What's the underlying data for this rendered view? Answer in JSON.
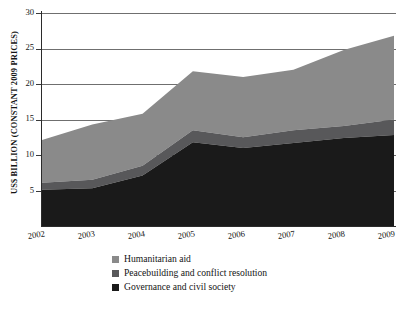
{
  "chart_data": {
    "type": "area",
    "title": "",
    "subtitle": "",
    "xlabel": "",
    "ylabel": "US$ BILLION (CONSTANT 2009 PRICES)",
    "stacked": true,
    "grid": true,
    "legend_position": "bottom",
    "x": [
      2002,
      2003,
      2004,
      2005,
      2006,
      2007,
      2008,
      2009
    ],
    "categories": [
      "2002",
      "2003",
      "2004",
      "2005",
      "2006",
      "2007",
      "2008",
      "2009"
    ],
    "xlim": [
      2002,
      2009
    ],
    "ylim": [
      0,
      30
    ],
    "yticks": [
      0,
      5,
      10,
      15,
      20,
      25,
      30
    ],
    "ytick_labels": [
      "0",
      "5",
      "10",
      "15",
      "20",
      "25",
      "30"
    ],
    "series": [
      {
        "name": "Governance and civil society",
        "color": "#1a1a1a",
        "values": [
          5.1,
          5.3,
          7.1,
          11.8,
          11.0,
          11.7,
          12.4,
          12.8
        ]
      },
      {
        "name": "Peacebuilding and conflict resolution",
        "color": "#58585a",
        "values": [
          1.0,
          1.2,
          1.4,
          1.7,
          1.5,
          1.8,
          1.7,
          2.2
        ]
      },
      {
        "name": "Humanitarian aid",
        "color": "#8a8a8a",
        "values": [
          6.0,
          7.8,
          7.3,
          8.3,
          8.5,
          8.5,
          10.7,
          11.8
        ]
      }
    ],
    "cumulative_tops": {
      "governance_and_civil_society": [
        5.1,
        5.3,
        7.1,
        11.8,
        11.0,
        11.7,
        12.4,
        12.8
      ],
      "plus_peacebuilding": [
        6.1,
        6.5,
        8.5,
        13.5,
        12.5,
        13.5,
        14.1,
        15.0
      ],
      "total": [
        12.1,
        14.3,
        15.8,
        21.8,
        21.0,
        22.0,
        24.8,
        26.8
      ]
    }
  },
  "legend": {
    "items": [
      {
        "label": "Humanitarian aid",
        "color": "#8a8a8a"
      },
      {
        "label": "Peacebuilding and conflict resolution",
        "color": "#58585a"
      },
      {
        "label": "Governance and civil society",
        "color": "#1a1a1a"
      }
    ]
  },
  "axes": {
    "y_title": "US$ BILLION (CONSTANT 2009 PRICES)",
    "y_ticks": [
      "30",
      "25",
      "20",
      "15",
      "10",
      "5",
      "0"
    ],
    "x_ticks": [
      "2002",
      "2003",
      "2004",
      "2005",
      "2006",
      "2007",
      "2008",
      "2009"
    ]
  }
}
